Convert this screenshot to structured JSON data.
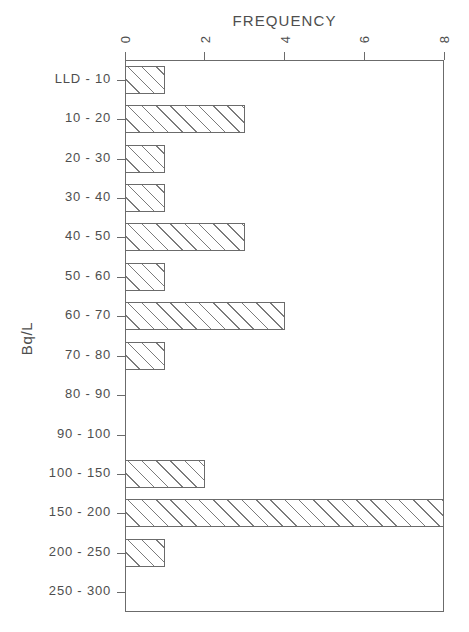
{
  "chart_data": {
    "type": "bar",
    "orientation": "horizontal",
    "title": "FREQUENCY",
    "xlabel": "FREQUENCY",
    "ylabel": "Bq/L",
    "xlim": [
      0,
      8
    ],
    "ylim_categories": 14,
    "grid": false,
    "legend": null,
    "xticks": [
      0,
      2,
      4,
      6,
      8
    ],
    "xtick_labels": [
      "0",
      "2",
      "4",
      "6",
      "8"
    ],
    "categories": [
      "LLD  -  10",
      "10  -  20",
      "20  -  30",
      "30  -  40",
      "40  -  50",
      "50  -  60",
      "60  -  70",
      "70  -  80",
      "80  -  90",
      "90  -  100",
      "100  -  150",
      "150  -  200",
      "200  -  250",
      "250  -  300"
    ],
    "values": [
      1,
      3,
      1,
      1,
      3,
      1,
      4,
      1,
      0,
      0,
      2,
      8,
      1,
      0
    ]
  },
  "style": {
    "line_color": "#6b6b6b",
    "text_color": "#4e4e4e",
    "bar_fill": "#ffffff",
    "hatch_color": "#7b7b7b",
    "background": "#ffffff"
  }
}
